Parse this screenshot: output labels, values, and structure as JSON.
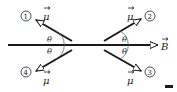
{
  "diagram": {
    "field_label": "B",
    "moment_label": "μ",
    "angle_label": "θ",
    "vectors": [
      {
        "id": "1",
        "label": "①",
        "direction": "upper-left"
      },
      {
        "id": "2",
        "label": "②",
        "direction": "upper-right"
      },
      {
        "id": "3",
        "label": "③",
        "direction": "lower-right"
      },
      {
        "id": "4",
        "label": "④",
        "direction": "lower-left"
      }
    ],
    "colors": {
      "line": "#1a1a1a",
      "text": "#222222"
    }
  }
}
